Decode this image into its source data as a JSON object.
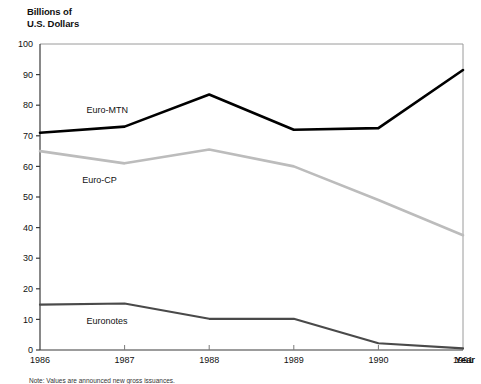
{
  "chart_data": {
    "type": "line",
    "title": "",
    "ylabel": "Billions of\nU.S. Dollars",
    "xlabel": "Year",
    "categories": [
      "1986",
      "1987",
      "1988",
      "1989",
      "1990",
      "1991"
    ],
    "x": [
      1986,
      1987,
      1988,
      1989,
      1990,
      1991
    ],
    "xlim": [
      1986,
      1991
    ],
    "ylim": [
      0,
      100
    ],
    "ytick_labels": [
      "0",
      "10",
      "20",
      "30",
      "40",
      "50",
      "60",
      "70",
      "80",
      "90",
      "100"
    ],
    "ytick_values": [
      0,
      10,
      20,
      30,
      40,
      50,
      60,
      70,
      80,
      90,
      100
    ],
    "xtick_labels": [
      "1986",
      "1987",
      "1988",
      "1989",
      "1990",
      "1991"
    ],
    "grid": false,
    "legend": "inline-labels",
    "series": [
      {
        "name": "Euro-MTN",
        "color": "#000000",
        "width": 2.6,
        "values": [
          71,
          73,
          83.5,
          72,
          72.5,
          91.5
        ],
        "label_x": 1986.55,
        "label_y": 78.5
      },
      {
        "name": "Euro-CP",
        "color": "#bcbcbc",
        "width": 2.6,
        "values": [
          65,
          61,
          65.5,
          60,
          49,
          37.5
        ],
        "label_x": 1986.5,
        "label_y": 55.5
      },
      {
        "name": "Euronotes",
        "color": "#4a4a4a",
        "width": 2.2,
        "values": [
          14.8,
          15.2,
          10.2,
          10.2,
          2.2,
          0.5
        ],
        "label_x": 1986.55,
        "label_y": 9.5
      }
    ],
    "note": "Note: Values are announced new gross issuances."
  }
}
